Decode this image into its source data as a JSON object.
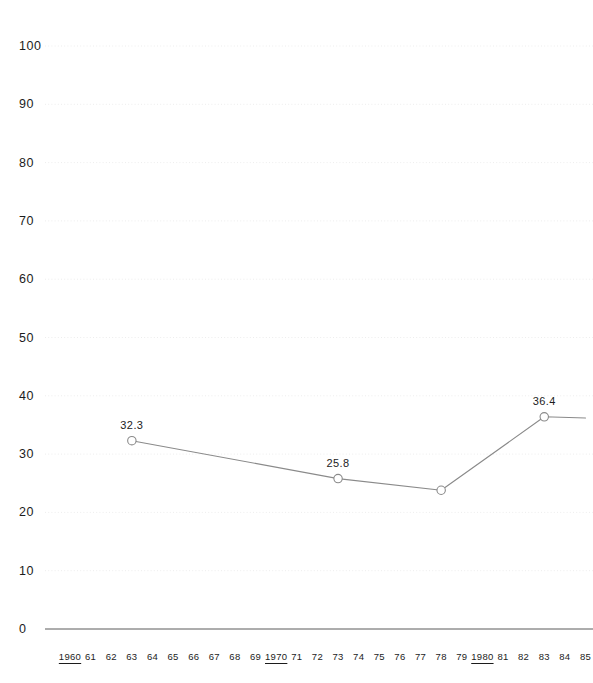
{
  "chart_data": {
    "type": "line",
    "title": "",
    "xlabel": "",
    "ylabel": "",
    "ylim": [
      0,
      100
    ],
    "ytick_step": 10,
    "yticks": [
      "0",
      "10",
      "20",
      "30",
      "40",
      "50",
      "60",
      "70",
      "80",
      "90",
      "100"
    ],
    "xlim": [
      1960,
      1985
    ],
    "grid": true,
    "legend": "none",
    "x": [
      1963,
      1973,
      1978,
      1983,
      1985
    ],
    "values": [
      32.3,
      25.8,
      23.8,
      36.4,
      36.2
    ],
    "point_labels": [
      "32.3",
      "25.8",
      "",
      "36.4",
      ""
    ],
    "markers": [
      {
        "year": 1963,
        "value": 32.3,
        "label": "32.3"
      },
      {
        "year": 1973,
        "value": 25.8,
        "label": "25.8"
      },
      {
        "year": 1978,
        "value": 23.8,
        "label": ""
      },
      {
        "year": 1983,
        "value": 36.4,
        "label": "36.4"
      }
    ],
    "xticks": [
      {
        "label": "1960",
        "decade": true
      },
      {
        "label": "61",
        "decade": false
      },
      {
        "label": "62",
        "decade": false
      },
      {
        "label": "63",
        "decade": false
      },
      {
        "label": "64",
        "decade": false
      },
      {
        "label": "65",
        "decade": false
      },
      {
        "label": "66",
        "decade": false
      },
      {
        "label": "67",
        "decade": false
      },
      {
        "label": "68",
        "decade": false
      },
      {
        "label": "69",
        "decade": false
      },
      {
        "label": "1970",
        "decade": true
      },
      {
        "label": "71",
        "decade": false
      },
      {
        "label": "72",
        "decade": false
      },
      {
        "label": "73",
        "decade": false
      },
      {
        "label": "74",
        "decade": false
      },
      {
        "label": "75",
        "decade": false
      },
      {
        "label": "76",
        "decade": false
      },
      {
        "label": "77",
        "decade": false
      },
      {
        "label": "78",
        "decade": false
      },
      {
        "label": "79",
        "decade": false
      },
      {
        "label": "1980",
        "decade": true
      },
      {
        "label": "81",
        "decade": false
      },
      {
        "label": "82",
        "decade": false
      },
      {
        "label": "83",
        "decade": false
      },
      {
        "label": "84",
        "decade": false
      },
      {
        "label": "85",
        "decade": false
      }
    ],
    "colors": {
      "line": "#8a8a8a",
      "marker_stroke": "#8a8a8a",
      "marker_fill": "#ffffff",
      "gridline": "#ededed",
      "baseline": "#5a5a5a",
      "text": "#1c1c1c",
      "background": "#ffffff"
    }
  }
}
